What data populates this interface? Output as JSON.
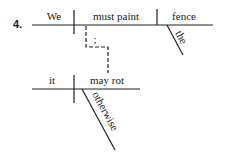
{
  "exercise": {
    "number": "4."
  },
  "clause_main": {
    "subject": "We",
    "verb": "must paint",
    "object": "fence",
    "object_modifier": "the"
  },
  "connector": {
    "label": ";"
  },
  "clause_second": {
    "subject": "it",
    "verb": "may rot",
    "verb_modifier": "otherwise"
  },
  "colors": {
    "ink": "#1a1a1a",
    "background": "#ffffff"
  }
}
